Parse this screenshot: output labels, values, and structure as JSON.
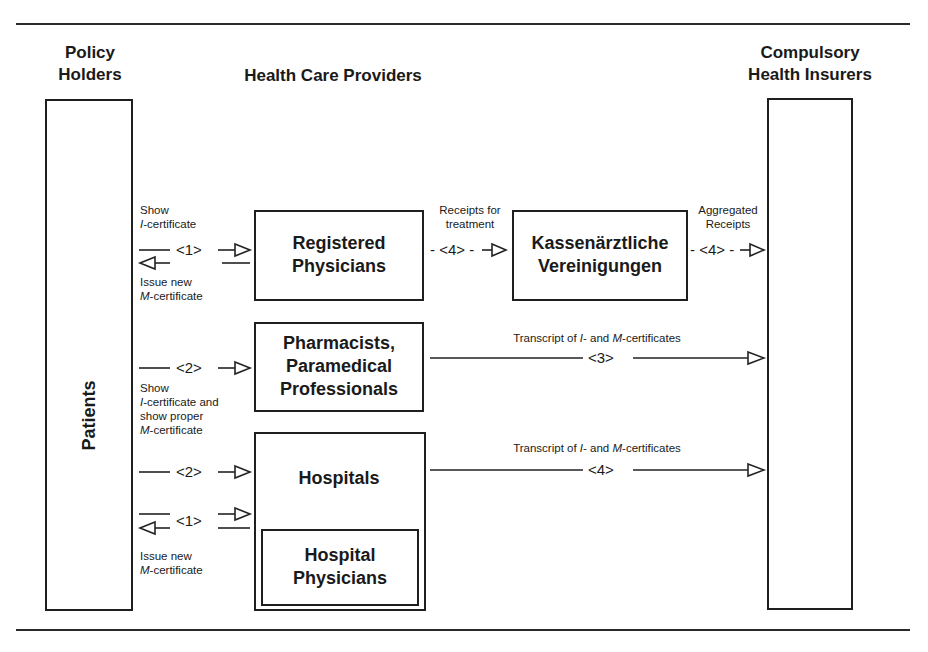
{
  "columns": {
    "policy_holders": {
      "line1": "Policy",
      "line2": "Holders"
    },
    "health_care_providers": "Health Care Providers",
    "compulsory_insurers": {
      "line1": "Compulsory",
      "line2": "Health Insurers"
    }
  },
  "boxes": {
    "patients": "Patients",
    "registered_physicians": {
      "line1": "Registered",
      "line2": "Physicians"
    },
    "kv": {
      "line1": "Kassenärztliche",
      "line2": "Vereinigungen"
    },
    "pharmacists": {
      "line1": "Pharmacists,",
      "line2": "Paramedical",
      "line3": "Professionals"
    },
    "hospitals": "Hospitals",
    "hospital_physicians": {
      "line1": "Hospital",
      "line2": "Physicians"
    }
  },
  "flows": {
    "physicians_exchange": {
      "number": "<1>",
      "top_label": {
        "line1": "Show",
        "line2_prefix": "I",
        "line2_rest": "-certificate"
      },
      "bottom_label": {
        "line1": "Issue new",
        "line2_prefix": "M",
        "line2_rest": "-certificate"
      }
    },
    "receipts_for_treatment": {
      "number": "- <4> -",
      "line1": "Receipts for",
      "line2": "treatment"
    },
    "aggregated_receipts": {
      "number": "- <4> -",
      "line1": "Aggregated",
      "line2": "Receipts"
    },
    "pharmacists_show": {
      "number": "<2>",
      "label": {
        "line1": "Show",
        "line2_prefix": "I",
        "line2_rest": "-certificate and",
        "line3": "show proper",
        "line4_prefix": "M",
        "line4_rest": "-certificate"
      }
    },
    "transcript_pharmacists": {
      "number": "<3>",
      "text_a": "Transcript of ",
      "i": "I",
      "text_b": "- and ",
      "m": "M",
      "text_c": "-certificates"
    },
    "hospitals_show": {
      "number": "<2>"
    },
    "transcript_hospitals": {
      "number": "<4>",
      "text_a": "Transcript of ",
      "i": "I",
      "text_b": "- and ",
      "m": "M",
      "text_c": "-certificates"
    },
    "hospital_physicians_exchange": {
      "number": "<1>",
      "bottom_label": {
        "line1": "Issue new",
        "line2_prefix": "M",
        "line2_rest": "-certificate"
      }
    }
  }
}
